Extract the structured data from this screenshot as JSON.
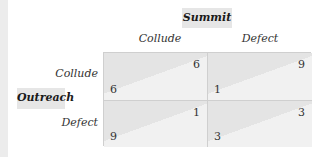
{
  "game": {
    "column_player": "Summit",
    "row_player": "Outreach",
    "column_strategies": [
      "Collude",
      "Defect"
    ],
    "row_strategies": [
      "Collude",
      "Defect"
    ],
    "payoffs": [
      [
        {
          "row": "6",
          "col": "6"
        },
        {
          "row": "1",
          "col": "9"
        }
      ],
      [
        {
          "row": "9",
          "col": "1"
        },
        {
          "row": "3",
          "col": "3"
        }
      ]
    ]
  }
}
